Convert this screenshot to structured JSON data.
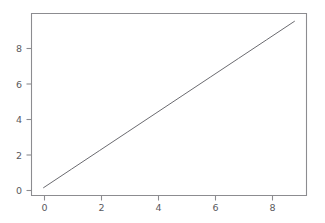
{
  "figure": {
    "background_color": "#ffffff",
    "axes_background_color": "#ffffff",
    "spine_color": "#8c8c90",
    "tick_color": "#8c8c90",
    "tick_label_color": "#5a5a5e",
    "line_color": "#6b6b70"
  },
  "chart_data": {
    "type": "line",
    "title": "",
    "subtitle": "",
    "xlabel": "",
    "ylabel": "",
    "x": [
      0,
      1,
      2,
      3,
      4,
      5,
      6,
      7,
      8,
      9
    ],
    "series": [
      {
        "name": "y = x",
        "values": [
          0,
          1,
          2,
          3,
          4,
          5,
          6,
          7,
          8,
          9
        ],
        "color": "#6b6b70",
        "linewidth": 1,
        "linestyle": "solid",
        "marker": "none"
      }
    ],
    "xlim": [
      -0.45,
      9.45
    ],
    "ylim": [
      -0.45,
      9.45
    ],
    "xticks": [
      0,
      2,
      4,
      6,
      8
    ],
    "yticks": [
      0,
      2,
      4,
      6,
      8
    ],
    "xtick_labels": [
      "0",
      "2",
      "4",
      "6",
      "8"
    ],
    "ytick_labels": [
      "0",
      "2",
      "4",
      "6",
      "8"
    ],
    "grid": false,
    "legend": false,
    "legend_position": "none",
    "annotations": []
  },
  "artifacts": {
    "description": "faint scanned bleed-through ghosting",
    "items": [
      {
        "text": "s Plots",
        "x": 236,
        "y": 78,
        "size": 13,
        "opacity": 0.5
      },
      {
        "text": "an",
        "x": 296,
        "y": 80,
        "size": 11,
        "opacity": 0.4
      },
      {
        "text": "an",
        "x": 50,
        "y": 122,
        "size": 9,
        "opacity": 0.35
      },
      {
        "text": "on",
        "x": 112,
        "y": 120,
        "size": 9,
        "opacity": 0.3
      },
      {
        "text": "inn",
        "x": 196,
        "y": 121,
        "size": 9,
        "opacity": 0.3
      },
      {
        "text": "ra",
        "x": 246,
        "y": 120,
        "size": 9,
        "opacity": 0.3
      },
      {
        "text": "sa",
        "x": 290,
        "y": 122,
        "size": 9,
        "opacity": 0.3
      },
      {
        "text": "no",
        "x": 60,
        "y": 142,
        "size": 9,
        "opacity": 0.3
      },
      {
        "text": "er",
        "x": 150,
        "y": 140,
        "size": 9,
        "opacity": 0.3
      },
      {
        "text": "sorte",
        "x": 216,
        "y": 142,
        "size": 9,
        "opacity": 0.3
      },
      {
        "text": "an",
        "x": 286,
        "y": 140,
        "size": 9,
        "opacity": 0.3
      },
      {
        "text": "nm",
        "x": 120,
        "y": 160,
        "size": 8,
        "opacity": 0.25
      }
    ]
  }
}
